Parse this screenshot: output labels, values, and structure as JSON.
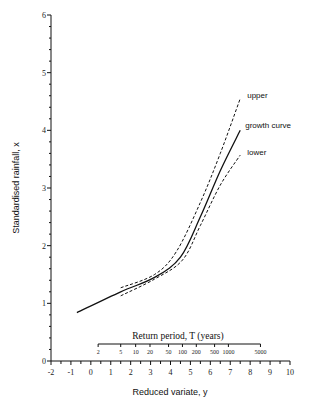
{
  "chart_data": {
    "type": "line",
    "title": "",
    "xlabel": "Reduced variate, y",
    "ylabel": "Standardised rainfall, x",
    "xlim": [
      -2,
      10
    ],
    "ylim": [
      0,
      6
    ],
    "xticks": [
      -2,
      -1,
      0,
      1,
      2,
      3,
      4,
      5,
      6,
      7,
      8,
      9,
      10
    ],
    "yticks": [
      0,
      1,
      2,
      3,
      4,
      5,
      6
    ],
    "grid": false,
    "legend": "inline labels at line ends",
    "secondary_axis": {
      "title": "Return period, T (years)",
      "ticks": [
        2,
        5,
        10,
        20,
        50,
        100,
        200,
        500,
        1000,
        5000
      ]
    },
    "series": [
      {
        "name": "growth curve",
        "style": "solid",
        "points": [
          [
            -0.7,
            0.84
          ],
          [
            1.5,
            1.2
          ],
          [
            3.2,
            1.45
          ],
          [
            4.5,
            1.8
          ],
          [
            5.5,
            2.5
          ],
          [
            6.5,
            3.3
          ],
          [
            7.5,
            4.0
          ]
        ]
      },
      {
        "name": "upper",
        "style": "dashed",
        "points": [
          [
            1.5,
            1.27
          ],
          [
            3.2,
            1.5
          ],
          [
            4.3,
            1.9
          ],
          [
            5.5,
            2.75
          ],
          [
            6.5,
            3.6
          ],
          [
            7.5,
            4.55
          ]
        ]
      },
      {
        "name": "lower",
        "style": "dashed",
        "points": [
          [
            1.5,
            1.13
          ],
          [
            3.2,
            1.42
          ],
          [
            4.6,
            1.75
          ],
          [
            5.5,
            2.35
          ],
          [
            6.5,
            3.05
          ],
          [
            7.5,
            3.57
          ]
        ]
      }
    ]
  }
}
